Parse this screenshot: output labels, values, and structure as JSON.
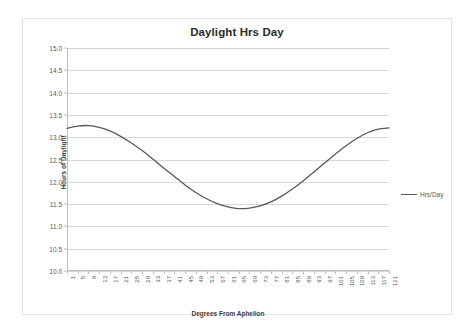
{
  "chart_data": {
    "type": "line",
    "title": "Daylight Hrs Day",
    "xlabel": "Degrees From Aphelion",
    "ylabel": "Hours of Daylight",
    "grid": true,
    "legend_position": "right",
    "ylim": [
      10.0,
      15.0
    ],
    "xlim": [
      1,
      121
    ],
    "yticks": [
      "10.0",
      "10.5",
      "11.0",
      "11.5",
      "12.0",
      "12.5",
      "13.0",
      "13.5",
      "14.0",
      "14.5",
      "15.0"
    ],
    "ytick_values": [
      10.0,
      10.5,
      11.0,
      11.5,
      12.0,
      12.5,
      13.0,
      13.5,
      14.0,
      14.5,
      15.0
    ],
    "xticks": [
      "1",
      "5",
      "9",
      "13",
      "17",
      "21",
      "25",
      "29",
      "33",
      "37",
      "41",
      "45",
      "49",
      "53",
      "57",
      "61",
      "65",
      "69",
      "73",
      "77",
      "81",
      "85",
      "89",
      "93",
      "97",
      "101",
      "105",
      "109",
      "113",
      "117",
      "121"
    ],
    "series": [
      {
        "name": "Hrs/Day",
        "color": "#585858",
        "x": [
          1,
          5,
          9,
          13,
          17,
          21,
          25,
          29,
          33,
          37,
          41,
          45,
          49,
          53,
          57,
          61,
          65,
          69,
          73,
          77,
          81,
          85,
          89,
          93,
          97,
          101,
          105,
          109,
          113,
          117,
          121
        ],
        "values": [
          13.2,
          13.25,
          13.26,
          13.22,
          13.14,
          13.02,
          12.87,
          12.7,
          12.51,
          12.31,
          12.12,
          11.93,
          11.76,
          11.62,
          11.51,
          11.44,
          11.4,
          11.41,
          11.46,
          11.55,
          11.68,
          11.84,
          12.02,
          12.22,
          12.42,
          12.62,
          12.81,
          12.97,
          13.1,
          13.18,
          13.21
        ]
      }
    ]
  },
  "legend": {
    "items": [
      {
        "label": "Hrs/Day",
        "color": "#585858"
      }
    ]
  }
}
